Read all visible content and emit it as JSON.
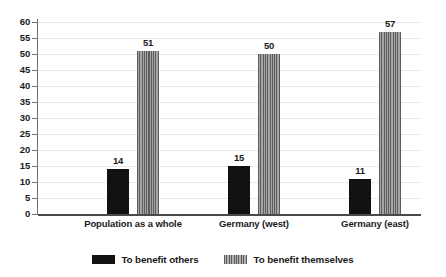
{
  "chart_data": {
    "type": "bar",
    "title": "",
    "subtitle": "",
    "xlabel": "",
    "ylabel": "",
    "ylim": [
      0,
      60
    ],
    "ytick_step": 5,
    "yticks": [
      60,
      55,
      50,
      45,
      40,
      35,
      30,
      25,
      20,
      15,
      10,
      5,
      0
    ],
    "categories": [
      "Population as a whole",
      "Germany (west)",
      "Germany (east)"
    ],
    "grid": true,
    "grid_axis": "y",
    "legend_position": "bottom-center",
    "series": [
      {
        "name": "To benefit others",
        "values": [
          14,
          15,
          11
        ],
        "color": "#111111",
        "pattern": "solid"
      },
      {
        "name": "To benefit themselves",
        "values": [
          51,
          50,
          57
        ],
        "color": "#7d7d7d",
        "pattern": "vertical-stripes"
      }
    ],
    "data_labels": [
      [
        "14",
        "51"
      ],
      [
        "15",
        "50"
      ],
      [
        "11",
        "57"
      ]
    ]
  },
  "axis": {
    "ticks": [
      {
        "label": "60",
        "value": 60
      },
      {
        "label": "55",
        "value": 55
      },
      {
        "label": "50",
        "value": 50
      },
      {
        "label": "45",
        "value": 45
      },
      {
        "label": "40",
        "value": 40
      },
      {
        "label": "35",
        "value": 35
      },
      {
        "label": "30",
        "value": 30
      },
      {
        "label": "25",
        "value": 25
      },
      {
        "label": "20",
        "value": 20
      },
      {
        "label": "15",
        "value": 15
      },
      {
        "label": "10",
        "value": 10
      },
      {
        "label": "5",
        "value": 5
      },
      {
        "label": "0",
        "value": 0
      }
    ]
  },
  "groups": [
    {
      "label": "Population as a whole",
      "bars": [
        {
          "label": "14",
          "value": 14,
          "style": "solid"
        },
        {
          "label": "51",
          "value": 51,
          "style": "striped"
        }
      ]
    },
    {
      "label": "Germany (west)",
      "bars": [
        {
          "label": "15",
          "value": 15,
          "style": "solid"
        },
        {
          "label": "50",
          "value": 50,
          "style": "striped"
        }
      ]
    },
    {
      "label": "Germany (east)",
      "bars": [
        {
          "label": "11",
          "value": 11,
          "style": "solid"
        },
        {
          "label": "57",
          "value": 57,
          "style": "striped"
        }
      ]
    }
  ],
  "legend": {
    "items": [
      {
        "label": "To benefit others",
        "style": "solid"
      },
      {
        "label": "To benefit themselves",
        "style": "striped"
      }
    ]
  },
  "colors": {
    "series_others": "#111111",
    "series_themselves": "#7d7d7d",
    "grid": "#e8e8e8",
    "axis": "#4a4a4a",
    "text": "#1a1a1a",
    "background": "#ffffff"
  }
}
